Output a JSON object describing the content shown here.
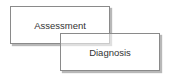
{
  "diagram": {
    "boxes": [
      {
        "label": "Assessment"
      },
      {
        "label": "Diagnosis"
      }
    ]
  }
}
